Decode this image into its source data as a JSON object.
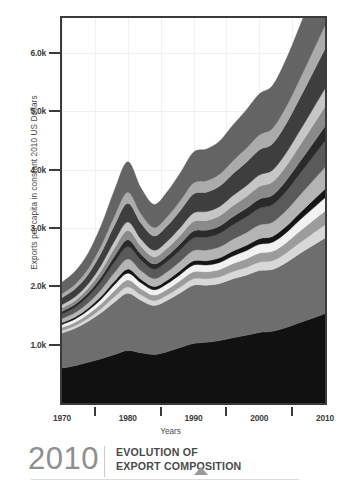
{
  "footer": {
    "year": "2010",
    "title_line1": "EVOLUTION OF",
    "title_line2": "EXPORT COMPOSITION",
    "marker": "triangle-up"
  },
  "chart_data": {
    "type": "area",
    "stacked": true,
    "title": "",
    "subtitle": "",
    "xlabel": "Years",
    "ylabel": "Exports per capita in constant 2010 US Dollars",
    "xlim": [
      1970,
      2010
    ],
    "ylim": [
      0,
      6600
    ],
    "xticks": [
      1970,
      1980,
      1990,
      2000,
      2010
    ],
    "xtick_labels": [
      "1970",
      "1980",
      "1990",
      "2000",
      "2010"
    ],
    "x_minor_ticks": [
      1975,
      1985,
      1995,
      2005
    ],
    "yticks": [
      1000,
      2000,
      3000,
      4000,
      5000,
      6000
    ],
    "ytick_labels": [
      "1.0k",
      "2.0k",
      "3.0k",
      "4.0k",
      "5.0k",
      "6.0k"
    ],
    "grid": true,
    "legend": "none",
    "x": [
      1970,
      1972,
      1974,
      1976,
      1978,
      1980,
      1982,
      1984,
      1986,
      1988,
      1990,
      1992,
      1994,
      1996,
      1998,
      2000,
      2002,
      2004,
      2006,
      2008,
      2010
    ],
    "series": [
      {
        "name": "layer-1",
        "color": "#111111",
        "values": [
          600,
          640,
          700,
          760,
          830,
          900,
          860,
          830,
          880,
          950,
          1020,
          1040,
          1070,
          1120,
          1160,
          1210,
          1230,
          1290,
          1370,
          1450,
          1530
        ]
      },
      {
        "name": "layer-2",
        "color": "#6e6e6e",
        "values": [
          600,
          640,
          700,
          790,
          900,
          980,
          900,
          840,
          880,
          940,
          1000,
          980,
          980,
          1010,
          1030,
          1060,
          1060,
          1110,
          1180,
          1240,
          1300
        ]
      },
      {
        "name": "layer-3",
        "color": "#d8d8d8",
        "values": [
          40,
          45,
          55,
          70,
          95,
          110,
          95,
          85,
          90,
          100,
          110,
          110,
          115,
          125,
          135,
          145,
          150,
          165,
          185,
          205,
          225
        ]
      },
      {
        "name": "layer-4",
        "color": "#9c9c9c",
        "values": [
          55,
          60,
          70,
          85,
          105,
          120,
          105,
          95,
          100,
          110,
          120,
          120,
          125,
          135,
          145,
          155,
          160,
          175,
          195,
          215,
          235
        ]
      },
      {
        "name": "layer-5",
        "color": "#f2f2f2",
        "values": [
          50,
          55,
          65,
          80,
          100,
          115,
          100,
          92,
          96,
          105,
          115,
          115,
          120,
          130,
          140,
          150,
          155,
          170,
          190,
          210,
          230
        ]
      },
      {
        "name": "layer-6",
        "color": "#151515",
        "values": [
          30,
          33,
          38,
          48,
          60,
          70,
          62,
          56,
          60,
          66,
          72,
          74,
          78,
          84,
          90,
          96,
          100,
          110,
          122,
          136,
          150
        ]
      },
      {
        "name": "layer-7",
        "color": "#b4b4b4",
        "values": [
          70,
          78,
          92,
          118,
          150,
          175,
          150,
          135,
          145,
          160,
          178,
          182,
          190,
          205,
          220,
          235,
          245,
          270,
          300,
          335,
          370
        ]
      },
      {
        "name": "layer-8",
        "color": "#5a5a5a",
        "values": [
          80,
          90,
          108,
          140,
          180,
          210,
          180,
          162,
          174,
          192,
          214,
          220,
          230,
          248,
          266,
          285,
          297,
          327,
          364,
          406,
          450
        ]
      },
      {
        "name": "layer-9",
        "color": "#2a2a2a",
        "values": [
          45,
          50,
          60,
          78,
          100,
          118,
          100,
          90,
          97,
          107,
          119,
          122,
          128,
          138,
          148,
          158,
          165,
          182,
          203,
          226,
          250
        ]
      },
      {
        "name": "layer-10",
        "color": "#8a8a8a",
        "values": [
          60,
          68,
          82,
          106,
          136,
          160,
          136,
          122,
          132,
          146,
          162,
          167,
          175,
          188,
          202,
          216,
          225,
          248,
          276,
          308,
          340
        ]
      },
      {
        "name": "layer-11",
        "color": "#c6c6c6",
        "values": [
          55,
          62,
          75,
          97,
          124,
          146,
          124,
          112,
          120,
          133,
          148,
          152,
          159,
          172,
          184,
          197,
          205,
          226,
          252,
          281,
          310
        ]
      },
      {
        "name": "layer-12",
        "color": "#3e3e3e",
        "values": [
          120,
          136,
          164,
          212,
          272,
          320,
          272,
          244,
          263,
          291,
          324,
          333,
          349,
          376,
          404,
          432,
          450,
          496,
          552,
          616,
          680
        ]
      },
      {
        "name": "layer-13",
        "color": "#ababab",
        "values": [
          70,
          80,
          96,
          124,
          160,
          188,
          160,
          144,
          155,
          171,
          190,
          196,
          205,
          221,
          237,
          254,
          264,
          291,
          324,
          362,
          400
        ]
      },
      {
        "name": "layer-14",
        "color": "#646464",
        "values": [
          195,
          222,
          268,
          346,
          444,
          522,
          444,
          398,
          429,
          475,
          528,
          543,
          569,
          613,
          659,
          706,
          734,
          810,
          901,
          1005,
          1110
        ]
      }
    ],
    "totals": [
      2070,
      2319,
      2573,
      3054,
      3656,
      4134,
      3688,
      3405,
      3621,
      3946,
      4310,
      4354,
      4492,
      4765,
      5020,
      5295,
      5440,
      5970,
      6614,
      7195,
      7580
    ]
  }
}
